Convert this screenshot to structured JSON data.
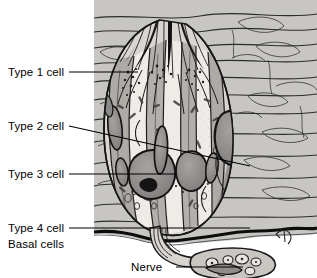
{
  "figure": {
    "background_color": "#ffffff",
    "tissue_tone": "#b9b9b9",
    "epithelium_tone": "#d2d2d2",
    "cytoplasm_light": "#ebe8e4",
    "nucleus_tone": "#8f8d8c",
    "ink_color": "#1a1a1a"
  },
  "labels": [
    {
      "id": "type-1-cell",
      "text": "Type 1 cell",
      "text_x": 8,
      "text_y": 76,
      "leader": {
        "x1": 69,
        "y1": 72,
        "x2": 138,
        "y2": 72
      }
    },
    {
      "id": "type-2-cell",
      "text": "Type 2 cell",
      "text_x": 8,
      "text_y": 130,
      "leader": {
        "x1": 69,
        "y1": 126,
        "x2": 250,
        "y2": 166
      }
    },
    {
      "id": "type-3-cell",
      "text": "Type 3 cell",
      "text_x": 8,
      "text_y": 178,
      "leader": {
        "x1": 69,
        "y1": 174,
        "x2": 176,
        "y2": 174
      }
    },
    {
      "id": "type-4-cell",
      "text": "Type 4 cell",
      "text_x": 8,
      "text_y": 232,
      "leader": {
        "x1": 69,
        "y1": 228,
        "x2": 250,
        "y2": 228
      }
    },
    {
      "id": "basal-cells",
      "text": "Basal cells",
      "text_x": 8,
      "text_y": 248,
      "leader": null
    },
    {
      "id": "nerve",
      "text": "Nerve",
      "text_x": 131,
      "text_y": 271,
      "leader": {
        "x1": 176,
        "y1": 267,
        "x2": 243,
        "y2": 267
      }
    }
  ],
  "structures": [
    {
      "id": "taste-pore",
      "name": "taste pore with microvilli"
    },
    {
      "id": "stratified-epithelium",
      "name": "surrounding stratified squamous epithelium"
    },
    {
      "id": "taste-bud-body",
      "name": "ovoid taste bud"
    },
    {
      "id": "basement-membrane",
      "name": "basement membrane"
    },
    {
      "id": "nerve-bundle",
      "name": "nerve fiber bundle"
    },
    {
      "id": "artist-signature",
      "name": "artist signature mark"
    }
  ]
}
